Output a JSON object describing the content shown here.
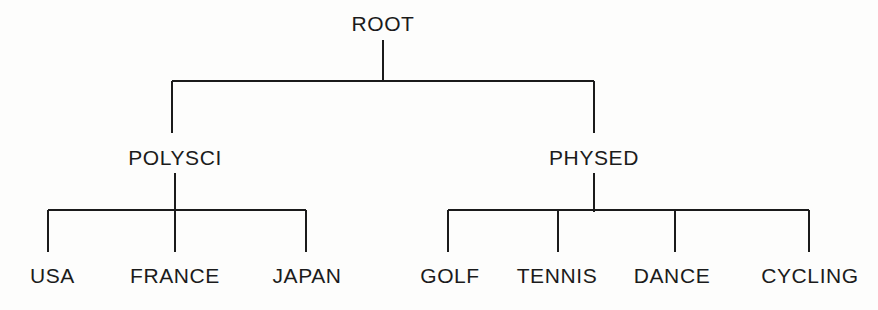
{
  "diagram": {
    "type": "tree",
    "background_color": "#fdfdfc",
    "line_color": "#1b1b1b",
    "text_color": "#1b1b1b",
    "line_width": 2,
    "levels": 3,
    "node_count": 10
  },
  "nodes": {
    "root": {
      "label": "ROOT",
      "x": 383,
      "y": 30,
      "level": 0
    },
    "polysci": {
      "label": "POLYSCI",
      "x": 175,
      "y": 164,
      "level": 1
    },
    "physed": {
      "label": "PHYSED",
      "x": 594,
      "y": 164,
      "level": 1
    },
    "usa": {
      "label": "USA",
      "x": 48,
      "y": 281,
      "level": 2
    },
    "france": {
      "label": "FRANCE",
      "x": 175,
      "y": 281,
      "level": 2
    },
    "japan": {
      "label": "JAPAN",
      "x": 306,
      "y": 281,
      "level": 2
    },
    "golf": {
      "label": "GOLF",
      "x": 450,
      "y": 281,
      "level": 2
    },
    "tennis": {
      "label": "TENNIS",
      "x": 558,
      "y": 281,
      "level": 2
    },
    "dance": {
      "label": "DANCE",
      "x": 675,
      "y": 281,
      "level": 2
    },
    "cycling": {
      "label": "CYCLING",
      "x": 809,
      "y": 281,
      "level": 2
    }
  },
  "edges": [
    {
      "from": "root",
      "to": "polysci"
    },
    {
      "from": "root",
      "to": "physed"
    },
    {
      "from": "polysci",
      "to": "usa"
    },
    {
      "from": "polysci",
      "to": "france"
    },
    {
      "from": "polysci",
      "to": "japan"
    },
    {
      "from": "physed",
      "to": "golf"
    },
    {
      "from": "physed",
      "to": "tennis"
    },
    {
      "from": "physed",
      "to": "dance"
    },
    {
      "from": "physed",
      "to": "cycling"
    }
  ],
  "geometry": {
    "root_stem": {
      "x": 383,
      "y1": 40,
      "y2": 81
    },
    "level1_bar": {
      "y": 81,
      "x1": 172,
      "x2": 594
    },
    "level1_drop_left": {
      "x": 172,
      "y1": 81,
      "y2": 133
    },
    "level1_drop_right": {
      "x": 594,
      "y1": 81,
      "y2": 133
    },
    "polysci_stem": {
      "x": 175,
      "y1": 173,
      "y2": 210
    },
    "physed_stem": {
      "x": 594,
      "y1": 173,
      "y2": 210
    },
    "polysci_bar": {
      "y": 210,
      "x1": 48,
      "x2": 306
    },
    "physed_bar": {
      "y": 210,
      "x1": 448,
      "x2": 809
    },
    "leaf_stub_top": 210,
    "leaf_stub_bottom": 252,
    "leaf_stubs_left": [
      48,
      175,
      306
    ],
    "leaf_stubs_right": [
      448,
      558,
      675,
      809
    ]
  }
}
